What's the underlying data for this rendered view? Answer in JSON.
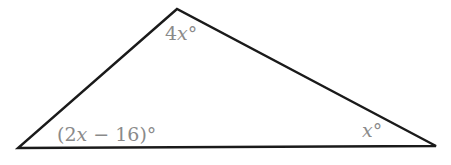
{
  "diagram": {
    "type": "triangle",
    "stroke_color": "#1a1a1a",
    "label_color": "#8a8a8a",
    "vertices": {
      "top": {
        "x": 177,
        "y": 9
      },
      "bottom_left": {
        "x": 18,
        "y": 148
      },
      "bottom_right": {
        "x": 436,
        "y": 146
      }
    },
    "angles": {
      "top": {
        "coef": "4",
        "var": "x",
        "suffix": "°"
      },
      "bottom_left": {
        "prefix": "(2",
        "var": "x",
        "suffix": " − 16)°"
      },
      "bottom_right": {
        "coef": "",
        "var": "x",
        "suffix": "°"
      }
    }
  }
}
